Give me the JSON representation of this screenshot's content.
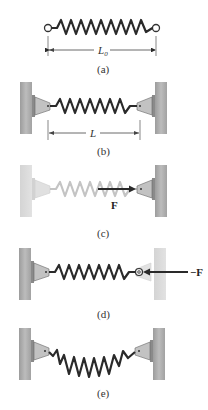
{
  "figure": {
    "panels": [
      {
        "id": "a",
        "caption": "(a)",
        "dimension_label": "L",
        "dimension_subscript": "0",
        "state": "free spring, natural length"
      },
      {
        "id": "b",
        "caption": "(b)",
        "dimension_label": "L",
        "state": "spring attached between two walls"
      },
      {
        "id": "c",
        "caption": "(c)",
        "force_label": "F",
        "state": "force applied by spring on right bracket (spring faded)"
      },
      {
        "id": "d",
        "caption": "(d)",
        "force_label": "−F",
        "state": "force applied on spring end (right wall faded)"
      },
      {
        "id": "e",
        "caption": "(e)",
        "state": "spring compressed / sagging between walls"
      }
    ]
  },
  "colors": {
    "wall": "#a9a9a9",
    "wall_faded": "#d8d8d8",
    "spring": "#2a2a2a",
    "spring_faded": "#bdbdbd",
    "bracket": "#b5b5b5",
    "arrow": "#2a2a2a"
  }
}
